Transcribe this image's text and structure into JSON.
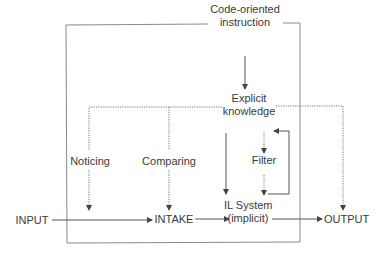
{
  "diagram": {
    "title": "",
    "nodes": {
      "code_instruction": {
        "line1": "Code-oriented",
        "line2": "instruction"
      },
      "explicit_knowledge": {
        "line1": "Explicit",
        "line2": "knowledge"
      },
      "noticing": {
        "label": "Noticing"
      },
      "comparing": {
        "label": "Comparing"
      },
      "filter": {
        "label": "Filter"
      },
      "input": {
        "label": "INPUT"
      },
      "intake": {
        "label": "INTAKE"
      },
      "il_system": {
        "line1": "IL System",
        "line2": "(implicit)"
      },
      "output": {
        "label": "OUTPUT"
      }
    },
    "edges": [
      {
        "from": "Code-oriented instruction",
        "to": "Explicit knowledge",
        "style": "solid"
      },
      {
        "from": "Explicit knowledge",
        "to": "Noticing",
        "style": "dotted"
      },
      {
        "from": "Explicit knowledge",
        "to": "Comparing",
        "style": "dotted"
      },
      {
        "from": "Explicit knowledge",
        "to": "OUTPUT",
        "style": "dotted"
      },
      {
        "from": "Explicit knowledge",
        "to": "IL System (implicit)",
        "style": "solid"
      },
      {
        "from": "Noticing",
        "to": "INTAKE line",
        "style": "dotted"
      },
      {
        "from": "Comparing",
        "to": "INTAKE",
        "style": "dotted"
      },
      {
        "from": "Filter",
        "to": "IL System (implicit)",
        "style": "dotted"
      },
      {
        "from": "IL System (implicit)",
        "to": "Filter",
        "style": "solid-loop"
      },
      {
        "from": "INPUT",
        "to": "INTAKE",
        "style": "solid"
      },
      {
        "from": "INTAKE",
        "to": "IL System (implicit)",
        "style": "solid"
      },
      {
        "from": "IL System (implicit)",
        "to": "OUTPUT",
        "style": "solid"
      }
    ],
    "colors": {
      "line": "#555555",
      "box": "#8a8a8a",
      "text": "#3a3a3a"
    }
  }
}
